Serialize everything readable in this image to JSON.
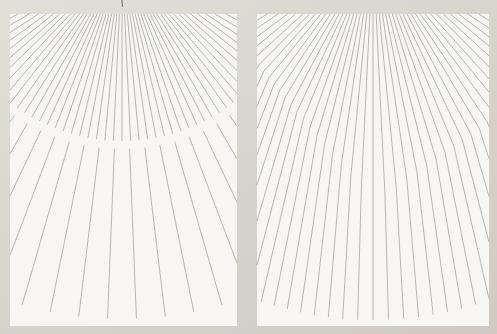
{
  "page": {
    "width": 497,
    "height": 334,
    "background_color": "#d8d4ce",
    "panel_background_color": "#f7f6f2",
    "line_color": "#8e8880",
    "line_width": 0.65,
    "line_opacity": 0.9
  },
  "figure": {
    "panels": [
      {
        "id": "edge-panel",
        "x": 10,
        "y": 14,
        "width": 227,
        "height": 312,
        "vanishing_point": {
          "x": 112,
          "y": -55
        },
        "upper_fan": {
          "step_deg": 2.7,
          "range_deg": 64,
          "radius_end": 182
        },
        "lower_fan": {
          "step_deg": 4.6,
          "offset_deg": 2.3,
          "range_deg": 40,
          "radius_start": 190,
          "radius_end": 360
        },
        "tick_mark": {
          "x": 112,
          "y1": -14,
          "y2": -7
        }
      },
      {
        "id": "corner-panel",
        "x": 257,
        "y": 14,
        "width": 232,
        "height": 312,
        "vanishing_point": {
          "x": 116,
          "y": -64
        },
        "fan": {
          "step_deg": 2.8,
          "range_deg": 62
        },
        "bend_vertex": {
          "x": 116,
          "y": 189
        },
        "bend_left_end": {
          "x": 0,
          "y": 49
        },
        "bend_right_end": {
          "x": 232,
          "y": 107
        },
        "bend_angle_factor": 0.58,
        "total_ray_length": 370
      }
    ]
  }
}
